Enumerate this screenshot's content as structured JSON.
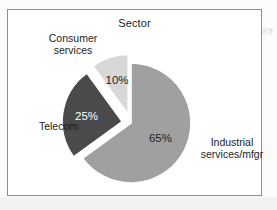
{
  "chart": {
    "title": "Sector",
    "frame_border_color": "#8b8b90",
    "background_color": "#ffffff"
  },
  "labels": {
    "consumer_services_line1": "Consumer",
    "consumer_services_line2": "services",
    "telecom": "Telecom",
    "industrial_line1": "Industrial",
    "industrial_line2": "services/mfgr"
  },
  "percent_labels": {
    "industrial": "65%",
    "telecom": "25%",
    "consumer_services": "10%"
  },
  "bleed_through": {
    "heading": "estment Strategy",
    "subheading": "iew",
    "line1": "are expecte",
    "line2": "he field",
    "line3": "as",
    "line4": "the operations",
    "line5": "ategy that anticip"
  },
  "chart_data": {
    "type": "pie",
    "title": "Sector",
    "xlabel": "",
    "ylabel": "",
    "legend_position": "none",
    "labels_outside": true,
    "start_angle_deg": 0,
    "direction": "clockwise",
    "categories": [
      "Industrial services/mfgr",
      "Telecom",
      "Consumer services"
    ],
    "values": [
      65,
      25,
      10
    ],
    "value_suffix": "%",
    "data_labels": [
      "65%",
      "25%",
      "10%"
    ],
    "colors": [
      "#a0a0a0",
      "#4a4a4a",
      "#d8d8d8"
    ],
    "slice_edge_color": "#ffffff",
    "exploded": [
      false,
      true,
      true
    ],
    "explode_offset_px": [
      0,
      9,
      9
    ]
  },
  "geometry": {
    "center_x": 123,
    "center_y": 113,
    "radius": 60
  }
}
